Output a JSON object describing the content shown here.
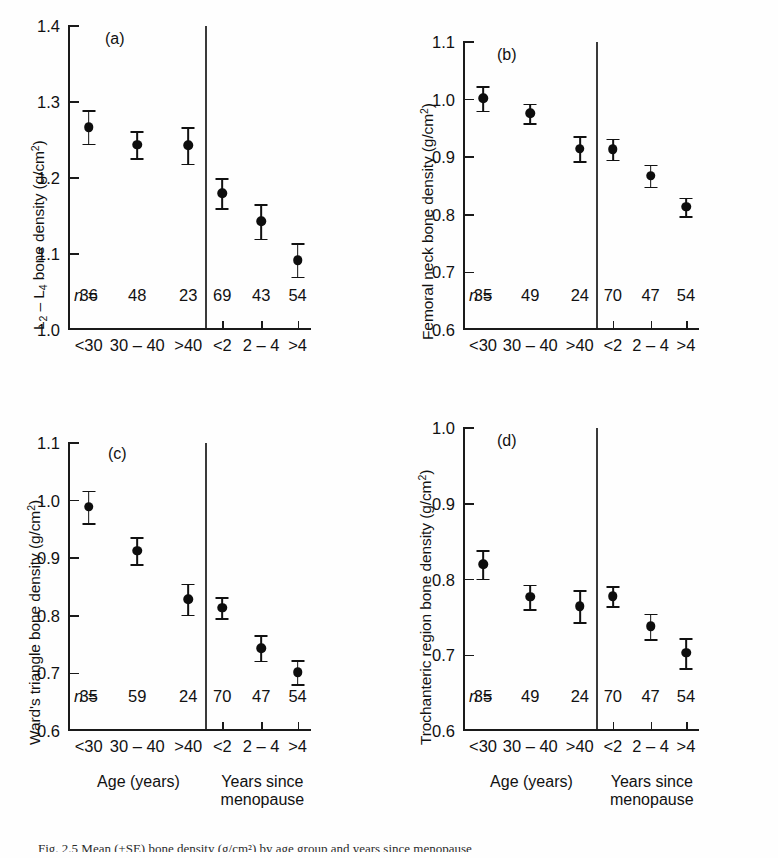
{
  "figure": {
    "caption_partial": "Fig. 2.5   Mean (±SE) bone density (g/cm²) by age group and years since menopause",
    "background": "#fefefe",
    "marker_color": "#0d0d0d",
    "axis_color": "#1a1a1a"
  },
  "axis_groups": {
    "left_label": "Age (years)",
    "right_label": "Years since\nmenopause",
    "left_label_line1": "Age (years)",
    "right_label_line1": "Years since",
    "right_label_line2": "menopause",
    "n_prefix": "n ="
  },
  "chart_data": [
    {
      "panel": "a",
      "type": "scatter",
      "title": "(a)",
      "ylabel": "L2 – L4 bone density (g/cm2)",
      "ylabel_parts": {
        "pre": "L",
        "sub1": "2",
        "mid": " – L",
        "sub2": "4",
        "post": " bone density (g/cm",
        "sup": "2",
        "tail": ")"
      },
      "xlabel": "",
      "ylim": [
        1.0,
        1.4
      ],
      "yticks": [
        1.0,
        1.1,
        1.2,
        1.3,
        1.4
      ],
      "ytick_labels": [
        "1.0",
        "1.1",
        "1.2",
        "1.3",
        "1.4"
      ],
      "grid": false,
      "categories": [
        "<30",
        "30 – 40",
        ">40",
        "<2",
        "2 – 4",
        ">4"
      ],
      "group_split_after": 3,
      "values": [
        1.267,
        1.244,
        1.243,
        1.18,
        1.143,
        1.092
      ],
      "errors": [
        0.022,
        0.018,
        0.024,
        0.02,
        0.023,
        0.022
      ],
      "n": [
        36,
        48,
        23,
        69,
        43,
        54
      ]
    },
    {
      "panel": "b",
      "type": "scatter",
      "title": "(b)",
      "ylabel": "Femoral neck bone density (g/cm2)",
      "ylabel_parts": {
        "pre": "Femoral neck bone density (g/cm",
        "sup": "2",
        "tail": ")"
      },
      "xlabel": "",
      "ylim": [
        0.6,
        1.1
      ],
      "yticks": [
        0.6,
        0.7,
        0.8,
        0.9,
        1.0,
        1.1
      ],
      "ytick_labels": [
        "0.6",
        "0.7",
        "0.8",
        "0.9",
        "1.0",
        "1.1"
      ],
      "grid": false,
      "categories": [
        "<30",
        "30 – 40",
        ">40",
        "<2",
        "2 – 4",
        ">4"
      ],
      "group_split_after": 3,
      "values": [
        1.002,
        0.976,
        0.915,
        0.914,
        0.868,
        0.814
      ],
      "errors": [
        0.021,
        0.017,
        0.022,
        0.018,
        0.019,
        0.016
      ],
      "n": [
        35,
        49,
        24,
        70,
        47,
        54
      ]
    },
    {
      "panel": "c",
      "type": "scatter",
      "title": "(c)",
      "ylabel": "Ward's triangle bone density (g/cm2)",
      "ylabel_parts": {
        "pre": "Ward's triangle bone density (g/cm",
        "sup": "2",
        "tail": ")"
      },
      "xlabel": "",
      "ylim": [
        0.6,
        1.1
      ],
      "yticks": [
        0.6,
        0.7,
        0.8,
        0.9,
        1.0,
        1.1
      ],
      "ytick_labels": [
        "0.6",
        "0.7",
        "0.8",
        "0.9",
        "1.0",
        "1.1"
      ],
      "grid": false,
      "categories": [
        "<30",
        "30 – 40",
        ">40",
        "<2",
        "2 – 4",
        ">4"
      ],
      "group_split_after": 3,
      "values": [
        0.989,
        0.913,
        0.829,
        0.814,
        0.744,
        0.702
      ],
      "errors": [
        0.028,
        0.023,
        0.027,
        0.018,
        0.022,
        0.021
      ],
      "n": [
        35,
        59,
        24,
        70,
        47,
        54
      ]
    },
    {
      "panel": "d",
      "type": "scatter",
      "title": "(d)",
      "ylabel": "Trochanteric region bone density (g/cm2)",
      "ylabel_parts": {
        "pre": "Trochanteric region bone density (g/cm",
        "sup": "2",
        "tail": ")"
      },
      "xlabel": "",
      "ylim": [
        0.6,
        1.0
      ],
      "yticks": [
        0.6,
        0.7,
        0.8,
        0.9,
        1.0
      ],
      "ytick_labels": [
        "0.6",
        "0.7",
        "0.8",
        "0.9",
        "1.0"
      ],
      "grid": false,
      "categories": [
        "<30",
        "30 – 40",
        ">40",
        "<2",
        "2 – 4",
        ">4"
      ],
      "group_split_after": 3,
      "values": [
        0.82,
        0.777,
        0.765,
        0.778,
        0.738,
        0.703
      ],
      "errors": [
        0.019,
        0.016,
        0.021,
        0.013,
        0.017,
        0.02
      ],
      "n": [
        35,
        49,
        24,
        70,
        47,
        54
      ]
    }
  ]
}
